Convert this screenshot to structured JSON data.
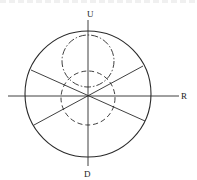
{
  "figure": {
    "labels": {
      "up": "U",
      "down": "D",
      "right": "R"
    },
    "colors": {
      "ink": "#2a2a2a",
      "background": "#ffffff"
    },
    "elements": [
      {
        "name": "outer-circle",
        "style": "solid"
      },
      {
        "name": "vertical-axis",
        "style": "solid",
        "ends": [
          "U",
          "D"
        ]
      },
      {
        "name": "horizontal-axis",
        "style": "solid",
        "ends": [
          "",
          "R"
        ]
      },
      {
        "name": "diagonal-line-1",
        "style": "solid"
      },
      {
        "name": "diagonal-line-2",
        "style": "solid"
      },
      {
        "name": "upper-circle",
        "style": "dash-dot"
      },
      {
        "name": "lower-circle",
        "style": "dashed"
      }
    ]
  }
}
